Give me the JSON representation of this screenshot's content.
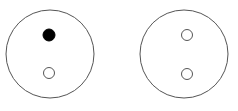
{
  "diagram": {
    "stroke_color": "#555555",
    "fill_color": "#000000",
    "background": "#ffffff",
    "circles": [
      {
        "name": "left-circle",
        "cx": 50,
        "cy": 54,
        "r": 44,
        "dots": [
          {
            "name": "top-dot",
            "cx": 49,
            "cy": 35,
            "r": 6,
            "filled": true
          },
          {
            "name": "bottom-dot",
            "cx": 49,
            "cy": 73,
            "r": 5.5,
            "filled": false
          }
        ]
      },
      {
        "name": "right-circle",
        "cx": 184,
        "cy": 54,
        "r": 44,
        "dots": [
          {
            "name": "top-dot",
            "cx": 187,
            "cy": 35,
            "r": 5.5,
            "filled": false
          },
          {
            "name": "bottom-dot",
            "cx": 187,
            "cy": 74,
            "r": 5.5,
            "filled": false
          }
        ]
      }
    ]
  }
}
